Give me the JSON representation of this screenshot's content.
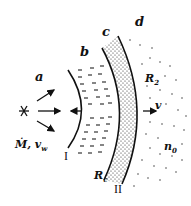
{
  "diagram": {
    "regions": [
      {
        "id": "a",
        "label": "a",
        "description": "free-flowing stellar wind"
      },
      {
        "id": "b",
        "label": "b",
        "description": "shocked wind (hot bubble)"
      },
      {
        "id": "c",
        "label": "c",
        "description": "shocked swept-up shell"
      },
      {
        "id": "d",
        "label": "d",
        "description": "ambient medium"
      }
    ],
    "source_label": "Ṁ, v",
    "source_label_sub": "w",
    "shock_labels": {
      "inner": "I",
      "outer": "II"
    },
    "radius_labels": {
      "contact": "R",
      "contact_sub": "c",
      "outer": "R",
      "outer_sub": "2"
    },
    "velocity_label": "v",
    "density_label": "n",
    "density_sub": "0",
    "colors": {
      "ink": "#111111",
      "background": "#ffffff"
    }
  }
}
